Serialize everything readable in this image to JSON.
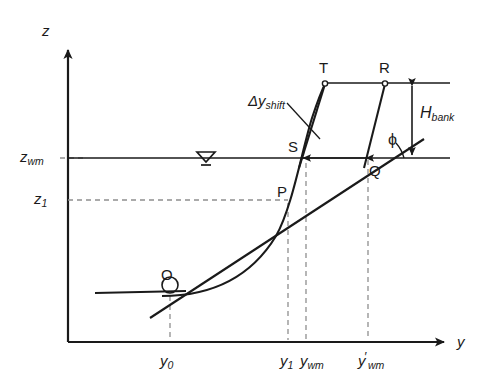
{
  "figure": {
    "type": "technical-line-diagram",
    "title_visible": false,
    "background_color": "#ffffff",
    "line_color": "#1a1a1a",
    "dashed_color": "#8a8a8a",
    "width": 498,
    "height": 390
  },
  "axes": {
    "vertical": {
      "label": "z",
      "origin_px": [
        68,
        342
      ],
      "tip_px": [
        68,
        42
      ]
    },
    "horizontal": {
      "label": "y",
      "origin_px": [
        68,
        342
      ],
      "tip_px": [
        452,
        342
      ]
    }
  },
  "value_labels": {
    "z_wm": {
      "base": "z",
      "sub": "wm",
      "level_px": 158
    },
    "z_1": {
      "base": "z",
      "sub": "1",
      "level_px": 200
    },
    "y_0": {
      "base": "y",
      "sub": "0",
      "prime": "",
      "pos_px": 170
    },
    "y_1": {
      "base": "y",
      "sub": "1",
      "prime": "",
      "pos_px": 288
    },
    "y_wm": {
      "base": "y",
      "sub": "wm",
      "prime": "",
      "pos_px": 306
    },
    "y_wm_prime": {
      "base": "y",
      "sub": "wm",
      "prime": "′",
      "pos_px": 368
    }
  },
  "points": [
    {
      "name": "O",
      "px": [
        170,
        295
      ],
      "marker": "circle-open"
    },
    {
      "name": "P",
      "px": [
        288,
        200
      ],
      "marker": "none"
    },
    {
      "name": "S",
      "px": [
        300,
        158
      ],
      "marker": "none"
    },
    {
      "name": "Q",
      "px": [
        368,
        158
      ],
      "marker": "none"
    },
    {
      "name": "T",
      "px": [
        325,
        83
      ],
      "marker": "circle-open"
    },
    {
      "name": "R",
      "px": [
        385,
        83
      ],
      "marker": "circle-open"
    }
  ],
  "annotations": {
    "delta_y_shift": {
      "base": "Δy",
      "sub": "shift",
      "pos_px": [
        250,
        98
      ]
    },
    "H_bank": {
      "base": "H",
      "sub": "bank",
      "pos_px": [
        418,
        110
      ]
    },
    "phi": {
      "text": "ϕ",
      "pos_px": [
        392,
        142
      ]
    },
    "water_surface_symbol": {
      "name": "water-level-triangle",
      "pos_px": [
        205,
        158
      ]
    }
  },
  "elements": {
    "water_surface_line": {
      "from_px": [
        68,
        158
      ],
      "to_px": [
        450,
        158
      ]
    },
    "bank_top_line": {
      "from_px": [
        325,
        83
      ],
      "to_px": [
        450,
        83
      ]
    },
    "bed_line_left": {
      "from_px": [
        95,
        293
      ],
      "to_px": [
        185,
        290
      ]
    },
    "bank_face_original": {
      "from_px": [
        300,
        158
      ],
      "to_px": [
        325,
        83
      ]
    },
    "bank_face_shifted": {
      "from_px": [
        368,
        158
      ],
      "to_px": [
        385,
        83
      ]
    },
    "tangent_line_phi": {
      "from_px": [
        228,
        268
      ],
      "to_px": [
        425,
        140
      ]
    },
    "profile_curve": "cubic bezier from (118,293) through O(170,295) rising through P(288,200) and S(300,158) up to T(325,83)",
    "dim_arrow_delta": {
      "from_px": [
        368,
        158
      ],
      "to_px": [
        300,
        158
      ],
      "style": "double-headed-inward"
    },
    "dim_arrow_H": {
      "from_px": [
        425,
        83
      ],
      "to_px": [
        425,
        158
      ],
      "style": "double-headed"
    }
  },
  "dashed_guides": [
    {
      "name": "z-wm-tick",
      "from_px": [
        62,
        158
      ],
      "to_px": [
        80,
        158
      ]
    },
    {
      "name": "z-1-level",
      "from_px": [
        68,
        200
      ],
      "to_px": [
        288,
        200
      ]
    },
    {
      "name": "y-0-drop",
      "from_px": [
        170,
        295
      ],
      "to_px": [
        170,
        342
      ]
    },
    {
      "name": "y-1-drop",
      "from_px": [
        288,
        200
      ],
      "to_px": [
        288,
        342
      ]
    },
    {
      "name": "y-wm-drop",
      "from_px": [
        306,
        160
      ],
      "to_px": [
        306,
        342
      ]
    },
    {
      "name": "y-wm-prime-drop",
      "from_px": [
        368,
        158
      ],
      "to_px": [
        368,
        342
      ]
    }
  ]
}
